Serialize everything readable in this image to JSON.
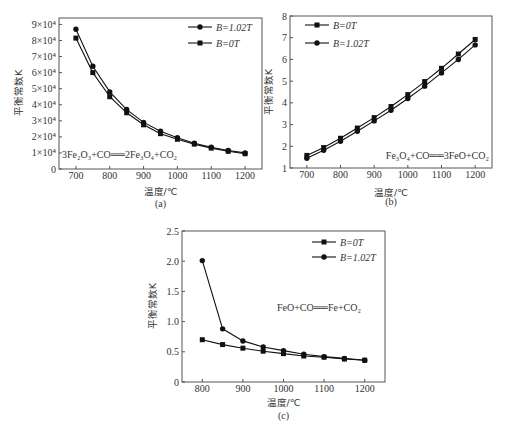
{
  "chart_data": [
    {
      "type": "line",
      "caption": "(a)",
      "title": "",
      "xlabel": "温度/℃",
      "ylabel": "平衡常数K",
      "annotation": "3Fe₂O₃+CO══2Fe₃O₄+CO₂",
      "grid": false,
      "legend_position": "top-right",
      "xlim": [
        650,
        1250
      ],
      "ylim": [
        0,
        94000
      ],
      "x": [
        700,
        750,
        800,
        850,
        900,
        950,
        1000,
        1050,
        1100,
        1150,
        1200
      ],
      "xticks": [
        700,
        800,
        900,
        1000,
        1100,
        1200
      ],
      "xtick_labels": [
        "700",
        "800",
        "900",
        "1000",
        "1100",
        "1200"
      ],
      "yticks": [
        0,
        10000,
        20000,
        30000,
        40000,
        50000,
        60000,
        70000,
        80000,
        90000
      ],
      "ytick_labels": [
        "0",
        "1×10⁴",
        "2×10⁴",
        "3×10⁴",
        "4×10⁴",
        "5×10⁴",
        "6×10⁴",
        "7×10⁴",
        "8×10⁴",
        "9×10⁴"
      ],
      "series": [
        {
          "name": "B=1.02T",
          "marker": "circle",
          "values": [
            87000,
            64000,
            48000,
            37000,
            29000,
            23500,
            19500,
            16000,
            13500,
            11500,
            10000
          ]
        },
        {
          "name": "B=0T",
          "marker": "square",
          "values": [
            81500,
            60000,
            45000,
            35000,
            27500,
            22000,
            18500,
            15500,
            13000,
            11000,
            9500
          ]
        }
      ]
    },
    {
      "type": "line",
      "caption": "(b)",
      "title": "",
      "xlabel": "温度/℃",
      "ylabel": "平衡常数K",
      "annotation": "Fe₃O₄+CO══3FeO+CO₂",
      "grid": false,
      "legend_position": "top-left",
      "xlim": [
        650,
        1250
      ],
      "ylim": [
        1,
        8
      ],
      "x": [
        700,
        750,
        800,
        850,
        900,
        950,
        1000,
        1050,
        1100,
        1150,
        1200
      ],
      "xticks": [
        700,
        800,
        900,
        1000,
        1100,
        1200
      ],
      "xtick_labels": [
        "700",
        "800",
        "900",
        "1000",
        "1100",
        "1200"
      ],
      "yticks": [
        1,
        2,
        3,
        4,
        5,
        6,
        7,
        8
      ],
      "ytick_labels": [
        "1",
        "2",
        "3",
        "4",
        "5",
        "6",
        "7",
        "8"
      ],
      "series": [
        {
          "name": "B=0T",
          "marker": "square",
          "values": [
            1.58,
            1.94,
            2.37,
            2.84,
            3.32,
            3.83,
            4.38,
            4.98,
            5.59,
            6.25,
            6.92
          ]
        },
        {
          "name": "B=1.02T",
          "marker": "circle",
          "values": [
            1.45,
            1.82,
            2.23,
            2.69,
            3.17,
            3.66,
            4.2,
            4.77,
            5.38,
            6.0,
            6.67
          ]
        }
      ]
    },
    {
      "type": "line",
      "caption": "(c)",
      "title": "",
      "xlabel": "温度/℃",
      "ylabel": "平衡常数K",
      "annotation": "FeO+CO══Fe+CO₂",
      "grid": false,
      "legend_position": "top-right",
      "xlim": [
        750,
        1250
      ],
      "ylim": [
        0,
        2.5
      ],
      "x": [
        800,
        850,
        900,
        950,
        1000,
        1050,
        1100,
        1150,
        1200
      ],
      "xticks": [
        800,
        900,
        1000,
        1100,
        1200
      ],
      "xtick_labels": [
        "800",
        "900",
        "1000",
        "1100",
        "1200"
      ],
      "yticks": [
        0,
        0.5,
        1.0,
        1.5,
        2.0,
        2.5
      ],
      "ytick_labels": [
        "0",
        "0.5",
        "1.0",
        "1.5",
        "2.0",
        "2.5"
      ],
      "series": [
        {
          "name": "B=0T",
          "marker": "square",
          "values": [
            0.7,
            0.62,
            0.56,
            0.51,
            0.47,
            0.43,
            0.41,
            0.38,
            0.36
          ]
        },
        {
          "name": "B=1.02T",
          "marker": "circle",
          "values": [
            2.01,
            0.88,
            0.68,
            0.58,
            0.52,
            0.46,
            0.42,
            0.39,
            0.36
          ]
        }
      ]
    }
  ]
}
